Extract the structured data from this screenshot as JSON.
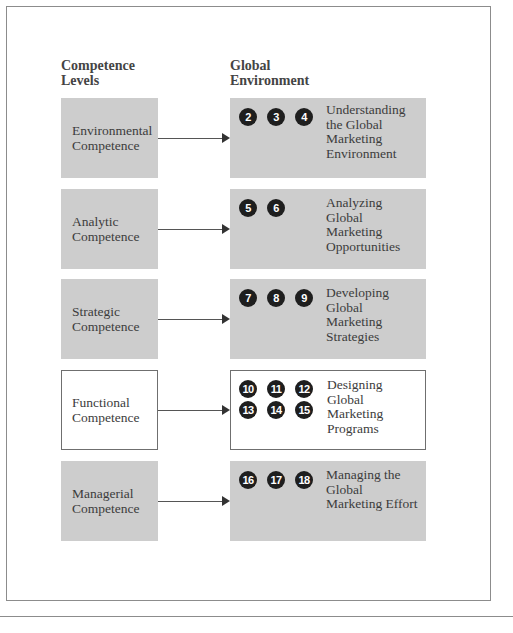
{
  "headings": {
    "left": "Competence Levels",
    "left_lines": [
      "Competence",
      "Levels"
    ],
    "right": "Global Environment",
    "right_lines": [
      "Global",
      "Environment"
    ]
  },
  "rows": [
    {
      "competence": [
        "Environmental",
        "Competence"
      ],
      "chapters": [
        "2",
        "3",
        "4"
      ],
      "topic": [
        "Understanding",
        "the Global",
        "Marketing",
        "Environment"
      ],
      "style": "shaded"
    },
    {
      "competence": [
        "Analytic",
        "Competence"
      ],
      "chapters": [
        "5",
        "6"
      ],
      "topic": [
        "Analyzing",
        "Global",
        "Marketing",
        "Opportunities"
      ],
      "style": "shaded"
    },
    {
      "competence": [
        "Strategic",
        "Competence"
      ],
      "chapters": [
        "7",
        "8",
        "9"
      ],
      "topic": [
        "Developing",
        "Global",
        "Marketing",
        "Strategies"
      ],
      "style": "shaded"
    },
    {
      "competence": [
        "Functional",
        "Competence"
      ],
      "chapters": [
        "10",
        "11",
        "12",
        "13",
        "14",
        "15"
      ],
      "topic": [
        "Designing",
        "Global",
        "Marketing",
        "Programs"
      ],
      "style": "outlined"
    },
    {
      "competence": [
        "Managerial",
        "Competence"
      ],
      "chapters": [
        "16",
        "17",
        "18"
      ],
      "topic": [
        "Managing the",
        "Global",
        "Marketing Effort"
      ],
      "style": "shaded"
    }
  ],
  "colors": {
    "box_fill": "#cdcdcd",
    "badge_fill": "#1e1e1e",
    "frame": "#8c8c8c",
    "text": "#3c3c3c"
  }
}
